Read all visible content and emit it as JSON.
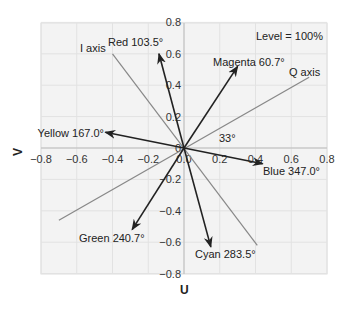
{
  "chart_data": {
    "type": "vector-scatter",
    "title": "",
    "annotation": "Level = 100%",
    "xlabel": "U",
    "ylabel": "V",
    "xlim": [
      -0.8,
      0.8
    ],
    "ylim": [
      -0.8,
      0.8
    ],
    "x_ticks": [
      "−0.8",
      "−0.6",
      "−0.4",
      "−0.2",
      "0.0",
      "0.2",
      "0.4",
      "0.6",
      "0.8"
    ],
    "y_ticks": [
      "0.8",
      "0.6",
      "0.4",
      "0.2",
      "0",
      "−0.2",
      "−0.4",
      "−0.6",
      "−0.8"
    ],
    "grid": true,
    "vectors": [
      {
        "name": "Red",
        "label": "Red 103.5°",
        "angle": 103.5,
        "u": -0.14,
        "v": 0.6
      },
      {
        "name": "Magenta",
        "label": "Magenta 60.7°",
        "angle": 60.7,
        "u": 0.3,
        "v": 0.52
      },
      {
        "name": "Yellow",
        "label": "Yellow 167.0°",
        "angle": 167.0,
        "u": -0.44,
        "v": 0.1
      },
      {
        "name": "Blue",
        "label": "Blue 347.0°",
        "angle": 347.0,
        "u": 0.44,
        "v": -0.1
      },
      {
        "name": "Green",
        "label": "Green 240.7°",
        "angle": 240.7,
        "u": -0.29,
        "v": -0.52
      },
      {
        "name": "Cyan",
        "label": "Cyan 283.5°",
        "angle": 283.5,
        "u": 0.15,
        "v": -0.63
      }
    ],
    "axes_lines": [
      {
        "name": "I axis",
        "label": "I axis",
        "from": [
          -0.4,
          0.6
        ],
        "to": [
          0.41,
          -0.62
        ]
      },
      {
        "name": "Q axis",
        "label": "Q axis",
        "from": [
          -0.7,
          -0.46
        ],
        "to": [
          0.7,
          0.45
        ]
      }
    ],
    "angle_annotation": "33°"
  }
}
